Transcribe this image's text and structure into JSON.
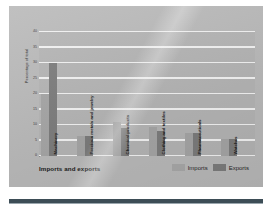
{
  "chart_data": {
    "type": "bar",
    "title": "Imports and exports",
    "xlabel": "",
    "ylabel": "Percentage of total",
    "ylim": [
      0,
      40
    ],
    "yticks": [
      0,
      5,
      10,
      15,
      20,
      25,
      30,
      35,
      40
    ],
    "ytick_labels": [
      "0",
      "5",
      "10",
      "15",
      "20",
      "25",
      "30",
      "35",
      "40"
    ],
    "grid": true,
    "legend_position": "bottom-right",
    "categories": [
      "Machinery",
      "Precious metals and jewelry",
      "Chemical products",
      "Clothing and textiles",
      "Pharmaceuticals",
      "Watches"
    ],
    "series": [
      {
        "name": "Imports",
        "color": "#a5a5a5",
        "values": [
          20.0,
          6.5,
          11.0,
          9.5,
          7.5,
          5.5
        ]
      },
      {
        "name": "Exports",
        "color": "#7c7c7c",
        "values": [
          30.0,
          6.5,
          9.0,
          8.0,
          7.5,
          5.5
        ]
      }
    ]
  },
  "legend": {
    "items": [
      {
        "label": "Imports",
        "color": "#a5a5a5"
      },
      {
        "label": "Exports",
        "color": "#7c7c7c"
      }
    ]
  },
  "caption": "Imports and exports"
}
